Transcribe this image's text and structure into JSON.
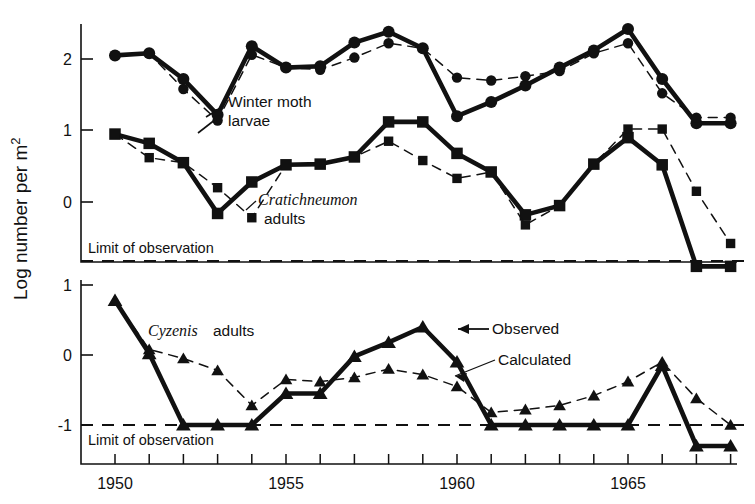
{
  "figure": {
    "ylabel": "Log number per m",
    "ylabel_sup": "2",
    "limit_label_top": "Limit of observation",
    "limit_label_bottom": "Limit of observation"
  },
  "annotations": {
    "winter_moth_line1": "Winter moth",
    "winter_moth_line2": "larvae",
    "cratichneumon_italic": "Cratichneumon",
    "cratichneumon_line2": "adults",
    "cyzenis_italic": "Cyzenis",
    "cyzenis_plain": "adults",
    "observed": "Observed",
    "calculated": "Calculated"
  },
  "chart_data": {
    "type": "line",
    "title": "",
    "xlabel": "",
    "ylabel": "Log number per m2",
    "grid": false,
    "legend_position": "inline-annotations",
    "x": [
      1950,
      1951,
      1952,
      1953,
      1954,
      1955,
      1956,
      1957,
      1958,
      1959,
      1960,
      1961,
      1962,
      1963,
      1964,
      1965,
      1966,
      1967,
      1968
    ],
    "xlim": [
      1949.2,
      1968.6
    ],
    "xticks": [
      1950,
      1951,
      1952,
      1953,
      1954,
      1955,
      1956,
      1957,
      1958,
      1959,
      1960,
      1961,
      1962,
      1963,
      1964,
      1965,
      1966,
      1967,
      1968
    ],
    "xticklabels_shown": [
      "1950",
      "1955",
      "1960",
      "1965"
    ],
    "panels": [
      {
        "name": "upper",
        "ylim": [
          -0.82,
          2.62
        ],
        "yticks": [
          0,
          1,
          2
        ],
        "yticklabels": [
          "0",
          "1",
          "2"
        ],
        "limit_of_observation": -0.82,
        "series": [
          {
            "name": "Winter moth larvae - Observed",
            "marker": "circle",
            "line": "solid",
            "x": [
              1950,
              1951,
              1952,
              1953,
              1954,
              1955,
              1956,
              1957,
              1958,
              1959,
              1960,
              1961,
              1962,
              1963,
              1964,
              1965,
              1966,
              1967,
              1968
            ],
            "values": [
              2.05,
              2.08,
              1.72,
              1.22,
              2.18,
              1.88,
              1.9,
              2.23,
              2.38,
              2.15,
              1.2,
              1.4,
              1.63,
              1.88,
              2.12,
              2.42,
              1.72,
              1.1,
              1.1
            ]
          },
          {
            "name": "Winter moth larvae - Calculated",
            "marker": "circle",
            "line": "dashed",
            "x": [
              1950,
              1951,
              1952,
              1953,
              1954,
              1955,
              1956,
              1957,
              1958,
              1959,
              1960,
              1961,
              1962,
              1963,
              1964,
              1965,
              1966,
              1967,
              1968
            ],
            "values": [
              2.05,
              2.08,
              1.58,
              1.14,
              2.06,
              1.88,
              1.85,
              2.02,
              2.22,
              2.15,
              1.74,
              1.7,
              1.76,
              1.83,
              2.08,
              2.22,
              1.52,
              1.18,
              1.18
            ]
          },
          {
            "name": "Cratichneumon adults - Observed",
            "marker": "square",
            "line": "solid",
            "x": [
              1950,
              1951,
              1952,
              1953,
              1954,
              1955,
              1956,
              1957,
              1958,
              1959,
              1960,
              1961,
              1962,
              1963,
              1964,
              1965,
              1966,
              1967,
              1968
            ],
            "values": [
              0.95,
              0.82,
              0.55,
              -0.16,
              0.28,
              0.52,
              0.53,
              0.63,
              1.12,
              1.12,
              0.68,
              0.42,
              -0.18,
              -0.05,
              0.53,
              0.9,
              0.52,
              -0.9,
              -0.9
            ]
          },
          {
            "name": "Cratichneumon adults - Calculated",
            "marker": "square",
            "line": "dashed",
            "x": [
              1950,
              1951,
              1952,
              1953,
              1954,
              1955,
              1956,
              1957,
              1958,
              1959,
              1960,
              1961,
              1962,
              1963,
              1964,
              1965,
              1966,
              1967,
              1968
            ],
            "values": [
              0.95,
              0.62,
              0.55,
              0.2,
              -0.22,
              0.52,
              0.53,
              0.63,
              0.85,
              0.58,
              0.33,
              0.42,
              -0.32,
              -0.05,
              0.53,
              1.02,
              1.02,
              0.15,
              -0.58
            ]
          }
        ]
      },
      {
        "name": "lower",
        "ylim": [
          -1.18,
          1.18
        ],
        "yticks": [
          -1,
          0,
          1
        ],
        "yticklabels": [
          "-1",
          "0",
          "1"
        ],
        "limit_of_observation": -1.0,
        "series": [
          {
            "name": "Cyzenis adults - Observed",
            "marker": "triangle",
            "line": "solid",
            "x": [
              1950,
              1951,
              1952,
              1953,
              1954,
              1955,
              1956,
              1957,
              1958,
              1959,
              1960,
              1961,
              1962,
              1963,
              1964,
              1965,
              1966,
              1967,
              1968
            ],
            "values": [
              0.78,
              0.02,
              -1.0,
              -1.0,
              -1.0,
              -0.55,
              -0.55,
              -0.02,
              0.18,
              0.4,
              -0.1,
              -1.0,
              -1.0,
              -1.0,
              -1.0,
              -1.0,
              -0.15,
              -1.3,
              -1.3
            ]
          },
          {
            "name": "Cyzenis adults - Calculated",
            "marker": "triangle",
            "line": "dashed",
            "x": [
              1950,
              1951,
              1952,
              1953,
              1954,
              1955,
              1956,
              1957,
              1958,
              1959,
              1960,
              1961,
              1962,
              1963,
              1964,
              1965,
              1966,
              1967,
              1968
            ],
            "values": [
              0.78,
              0.08,
              -0.05,
              -0.22,
              -0.72,
              -0.35,
              -0.38,
              -0.32,
              -0.2,
              -0.28,
              -0.45,
              -0.82,
              -0.78,
              -0.72,
              -0.58,
              -0.38,
              -0.1,
              -0.62,
              -1.0
            ]
          }
        ]
      }
    ]
  },
  "colors": {
    "ink": "#111111",
    "background": "#ffffff"
  }
}
